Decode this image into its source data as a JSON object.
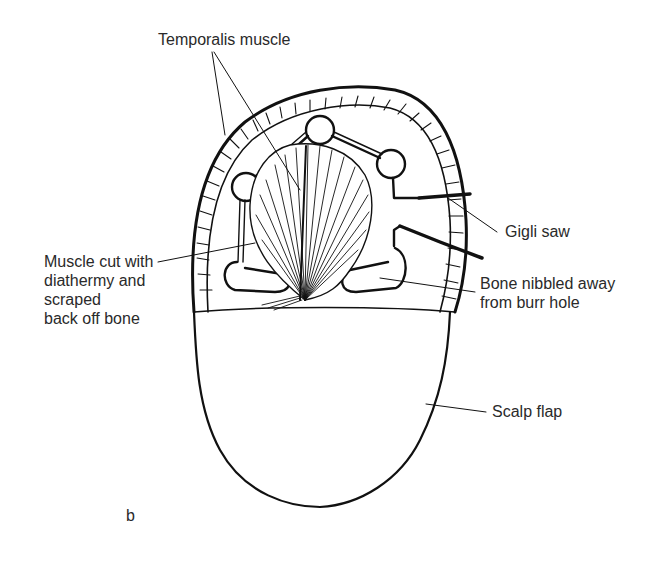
{
  "figure": {
    "panel_letter": "b",
    "labels": {
      "temporalis": "Temporalis muscle",
      "muscle_cut": "Muscle cut with\ndiathermy and\nscraped\nback off bone",
      "gigli": "Gigli saw",
      "bone_nibbled": "Bone nibbled away\nfrom burr hole",
      "scalp_flap": "Scalp flap"
    },
    "colors": {
      "ink": "#111111",
      "text": "#2a2a2a",
      "background": "#ffffff"
    }
  }
}
